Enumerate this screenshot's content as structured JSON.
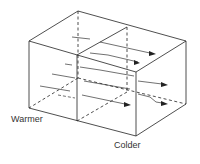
{
  "diagram": {
    "type": "isometric-box-airflow",
    "labels": {
      "warmer": "Warmer",
      "colder": "Colder"
    },
    "colors": {
      "line": "#222222",
      "flow": "#333333",
      "background": "#ffffff"
    }
  }
}
